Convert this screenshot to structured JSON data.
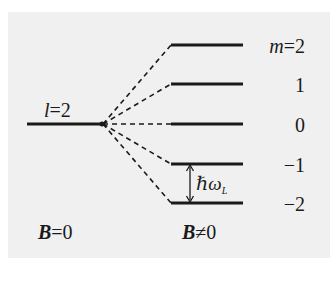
{
  "diagram": {
    "colors": {
      "background": "#ffffff",
      "panel": "#f0f0f0",
      "line": "#1a1a1a"
    },
    "unsplit_level": {
      "label_var": "l",
      "label_eq": "=2"
    },
    "split_levels": [
      {
        "m": "m=2",
        "m_var": "m",
        "m_val": "=2",
        "y": 45
      },
      {
        "m": "1",
        "y": 84
      },
      {
        "m": "0",
        "y": 124
      },
      {
        "m": "−1",
        "y": 164
      },
      {
        "m": "−2",
        "y": 203
      }
    ],
    "spacing_label": {
      "hbar": "ℏω",
      "subscript": "L"
    },
    "bottom_labels": {
      "left_var": "B",
      "left_rel": "=0",
      "right_var": "B",
      "right_rel": "≠0"
    }
  }
}
